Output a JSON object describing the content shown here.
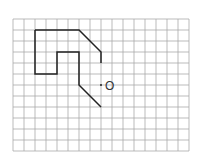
{
  "grid": {
    "origin_x": 13,
    "origin_y": 19,
    "cell": 11,
    "cols": 16,
    "rows": 12,
    "color": "#aaaaaa"
  },
  "figure": {
    "color": "#222222",
    "paths": [
      [
        [
          2,
          1
        ],
        [
          6,
          1
        ],
        [
          8,
          3
        ],
        [
          8,
          4
        ]
      ],
      [
        [
          2,
          1
        ],
        [
          2,
          5
        ],
        [
          4,
          5
        ],
        [
          4,
          3
        ],
        [
          6,
          3
        ],
        [
          6,
          6
        ],
        [
          8,
          8
        ]
      ]
    ]
  },
  "point": {
    "label": "O",
    "x": 8,
    "y": 6
  }
}
